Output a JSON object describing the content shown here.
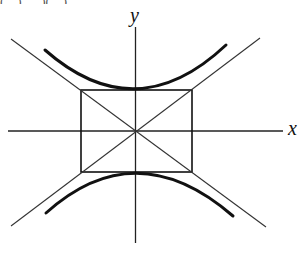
{
  "figure": {
    "caption_clipped": "(…) … )(…)",
    "axis_labels": {
      "x": "x",
      "y": "y"
    },
    "colors": {
      "ink": "#111111",
      "background": "#ffffff"
    },
    "elements": [
      "x-axis",
      "y-axis",
      "central rectangle",
      "two asymptote lines (diagonals of rectangle)",
      "upper hyperbola branch",
      "lower hyperbola branch"
    ]
  }
}
